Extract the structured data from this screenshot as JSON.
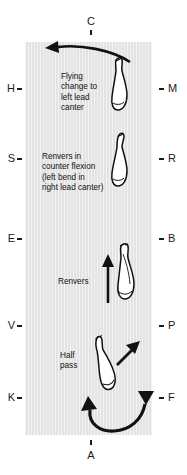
{
  "diagram": {
    "arena": {
      "background_color": "#e3e3e3",
      "ink_color": "#111111"
    },
    "markers": {
      "top": [
        {
          "letter": "C",
          "side": "top"
        }
      ],
      "bottom": [
        {
          "letter": "A",
          "side": "bottom"
        }
      ],
      "left": [
        {
          "letter": "H"
        },
        {
          "letter": "S"
        },
        {
          "letter": "E"
        },
        {
          "letter": "V"
        },
        {
          "letter": "K"
        }
      ],
      "right": [
        {
          "letter": "M"
        },
        {
          "letter": "R"
        },
        {
          "letter": "B"
        },
        {
          "letter": "P"
        },
        {
          "letter": "F"
        }
      ]
    },
    "annotations": [
      {
        "id": "flying-change",
        "lines": [
          "Flying",
          "change to",
          "left lead",
          "canter"
        ]
      },
      {
        "id": "renvers-counter-flexion",
        "lines": [
          "Renvers in",
          "counter flexion",
          "(left bend in",
          "right lead canter)"
        ]
      },
      {
        "id": "renvers",
        "lines": [
          "Renvers"
        ]
      },
      {
        "id": "half-pass",
        "lines": [
          "Half",
          "pass"
        ]
      }
    ],
    "horses": [
      {
        "id": "horse-flying-change",
        "orientation": "head-up"
      },
      {
        "id": "horse-renvers-counter-flexion",
        "orientation": "head-up"
      },
      {
        "id": "horse-renvers",
        "orientation": "head-up"
      },
      {
        "id": "horse-half-pass",
        "orientation": "tilted-left"
      }
    ],
    "arrows": [
      {
        "id": "arrow-flying-change-curve",
        "direction": "curving-left-along-top"
      },
      {
        "id": "arrow-renvers-straight",
        "direction": "up"
      },
      {
        "id": "arrow-half-pass-diagonal",
        "direction": "up-right"
      },
      {
        "id": "arrow-bottom-turn",
        "direction": "u-turn-toward-F"
      }
    ]
  }
}
